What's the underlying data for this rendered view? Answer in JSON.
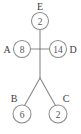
{
  "diagram": {
    "type": "node-link-tree",
    "background_color": "#ffffff",
    "line_color": "#8a8a8a",
    "text_color": "#55545a",
    "label_color": "#3d3c42",
    "nodes": [
      {
        "id": "E",
        "label": "E",
        "value": "2",
        "cx": 40,
        "cy": 21,
        "r": 8.5,
        "label_x": 40,
        "label_y": 6
      },
      {
        "id": "A",
        "label": "A",
        "value": "8",
        "cx": 22,
        "cy": 49,
        "r": 8.5,
        "label_x": 7,
        "label_y": 49
      },
      {
        "id": "D",
        "label": "D",
        "value": "14",
        "cx": 58,
        "cy": 49,
        "r": 8.5,
        "label_x": 73,
        "label_y": 49
      },
      {
        "id": "B",
        "label": "B",
        "value": "6",
        "cx": 22,
        "cy": 114,
        "r": 9.0,
        "label_x": 14,
        "label_y": 98
      },
      {
        "id": "C",
        "label": "C",
        "value": "2",
        "cx": 58,
        "cy": 114,
        "r": 9.0,
        "label_x": 66,
        "label_y": 98
      }
    ],
    "junction": {
      "x": 40,
      "y": 49
    },
    "fork": {
      "x": 40,
      "y": 78
    },
    "edges": [
      {
        "from": "E",
        "to": "junction",
        "x1": 40,
        "y1": 29.5,
        "x2": 40,
        "y2": 49
      },
      {
        "from": "A",
        "to": "junction",
        "x1": 30.5,
        "y1": 49,
        "x2": 40,
        "y2": 49
      },
      {
        "from": "junction",
        "to": "D",
        "x1": 40,
        "y1": 49,
        "x2": 49.5,
        "y2": 49
      },
      {
        "from": "junction",
        "to": "fork",
        "x1": 40,
        "y1": 49,
        "x2": 40,
        "y2": 78
      },
      {
        "from": "fork",
        "to": "B",
        "x1": 40,
        "y1": 78,
        "x2": 24.5,
        "y2": 105.5
      },
      {
        "from": "fork",
        "to": "C",
        "x1": 40,
        "y1": 78,
        "x2": 55.5,
        "y2": 105.5
      }
    ]
  }
}
